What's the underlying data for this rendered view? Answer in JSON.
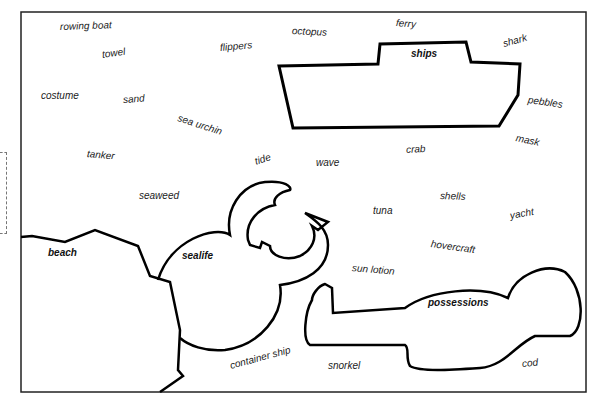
{
  "categories": {
    "beach": "beach",
    "sealife": "sealife",
    "ships": "ships",
    "possessions": "possessions"
  },
  "words": [
    {
      "text": "rowing boat",
      "x": 60,
      "y": 21,
      "rot": -2
    },
    {
      "text": "towel",
      "x": 102,
      "y": 49,
      "rot": -8
    },
    {
      "text": "flippers",
      "x": 220,
      "y": 42,
      "rot": -5
    },
    {
      "text": "octopus",
      "x": 292,
      "y": 25,
      "rot": 3
    },
    {
      "text": "ferry",
      "x": 396,
      "y": 17,
      "rot": 5
    },
    {
      "text": "shark",
      "x": 503,
      "y": 38,
      "rot": -15
    },
    {
      "text": "costume",
      "x": 41,
      "y": 90,
      "rot": 0
    },
    {
      "text": "sand",
      "x": 123,
      "y": 94,
      "rot": -4
    },
    {
      "text": "sea urchin",
      "x": 178,
      "y": 112,
      "rot": 18
    },
    {
      "text": "pebbles",
      "x": 528,
      "y": 94,
      "rot": 8
    },
    {
      "text": "mask",
      "x": 516,
      "y": 132,
      "rot": 12
    },
    {
      "text": "tanker",
      "x": 87,
      "y": 148,
      "rot": 5
    },
    {
      "text": "crab",
      "x": 406,
      "y": 144,
      "rot": -3
    },
    {
      "text": "tide",
      "x": 255,
      "y": 156,
      "rot": -18
    },
    {
      "text": "wave",
      "x": 316,
      "y": 157,
      "rot": 0
    },
    {
      "text": "seaweed",
      "x": 139,
      "y": 190,
      "rot": 0
    },
    {
      "text": "shells",
      "x": 440,
      "y": 190,
      "rot": 2
    },
    {
      "text": "tuna",
      "x": 373,
      "y": 205,
      "rot": 0
    },
    {
      "text": "yacht",
      "x": 510,
      "y": 210,
      "rot": -10
    },
    {
      "text": "hovercraft",
      "x": 431,
      "y": 238,
      "rot": 8
    },
    {
      "text": "sun lotion",
      "x": 352,
      "y": 262,
      "rot": 5
    },
    {
      "text": "container ship",
      "x": 230,
      "y": 360,
      "rot": -15
    },
    {
      "text": "snorkel",
      "x": 328,
      "y": 360,
      "rot": 0
    },
    {
      "text": "cod",
      "x": 522,
      "y": 358,
      "rot": -5
    }
  ]
}
